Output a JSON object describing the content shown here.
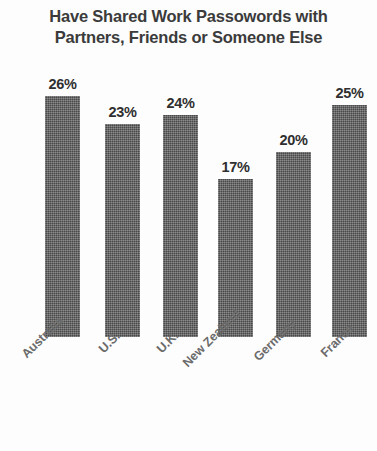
{
  "chart_data": {
    "type": "bar",
    "title": "Have Shared Work Passowords with Partners, Friends or Someone Else",
    "title_line1": "Have Shared Work Passowords with",
    "title_line2": "Partners, Friends or Someone Else",
    "xlabel": "",
    "ylabel": "",
    "ylim": [
      0,
      28
    ],
    "grid": false,
    "legend": false,
    "unit": "%",
    "bar_color": "#5a5a5a",
    "categories": [
      "Australia",
      "U.S.",
      "U.K.",
      "New Zealand",
      "Germany",
      "France"
    ],
    "values": [
      26,
      23,
      24,
      17,
      20,
      25
    ],
    "value_labels": [
      "26%",
      "23%",
      "24%",
      "17%",
      "20%",
      "25%"
    ],
    "bars": [
      {
        "category": "Australia",
        "value": 26,
        "label": "26%"
      },
      {
        "category": "U.S.",
        "value": 23,
        "label": "23%"
      },
      {
        "category": "U.K.",
        "value": 24,
        "label": "24%"
      },
      {
        "category": "New Zealand",
        "value": 17,
        "label": "17%"
      },
      {
        "category": "Germany",
        "value": 20,
        "label": "20%"
      },
      {
        "category": "France",
        "value": 25,
        "label": "25%"
      }
    ]
  }
}
